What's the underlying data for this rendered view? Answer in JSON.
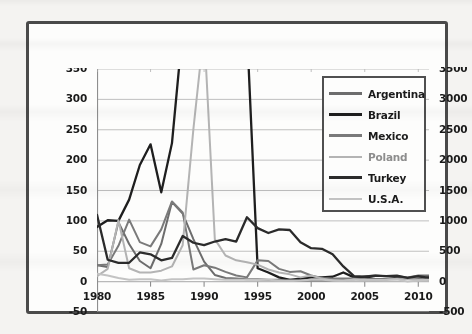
{
  "chart_data": {
    "type": "line",
    "title": "",
    "xlabel": "",
    "ylabel": "",
    "grid": true,
    "legend_position": "top-right-inside",
    "x": [
      1980,
      1981,
      1982,
      1983,
      1984,
      1985,
      1986,
      1987,
      1988,
      1989,
      1990,
      1991,
      1992,
      1993,
      1994,
      1995,
      1996,
      1997,
      1998,
      1999,
      2000,
      2001,
      2002,
      2003,
      2004,
      2005,
      2006,
      2007,
      2008,
      2009,
      2010,
      2011
    ],
    "x_ticks": [
      "1980",
      "1985",
      "1990",
      "1995",
      "2000",
      "2005",
      "2010"
    ],
    "x_tick_values": [
      1980,
      1985,
      1990,
      1995,
      2000,
      2005,
      2010
    ],
    "xlim": [
      1980,
      2011
    ],
    "axis_left": {
      "ticks": [
        -50,
        0,
        50,
        100,
        150,
        200,
        250,
        300,
        350
      ],
      "tick_labels": [
        "-50",
        "0",
        "50",
        "100",
        "150",
        "200",
        "250",
        "300",
        "350"
      ],
      "ylim": [
        -50,
        350
      ],
      "top_label_clipped": true
    },
    "axis_right": {
      "ticks": [
        -500,
        0,
        500,
        1000,
        1500,
        2000,
        2500,
        3000,
        3500
      ],
      "tick_labels": [
        "-500",
        "0",
        "500",
        "1000",
        "1500",
        "2000",
        "2500",
        "3000",
        "3500"
      ],
      "ylim": [
        -500,
        3500
      ]
    },
    "series": [
      {
        "name": "Argentina",
        "color": "#6d6d6d",
        "width": 2.0,
        "axis": "left",
        "values": [
          27,
          24,
          98,
          62,
          34,
          22,
          62,
          131,
          112,
          70,
          33,
          11,
          6,
          5,
          4,
          4,
          3,
          3,
          3,
          2,
          2,
          2,
          2,
          3,
          4,
          9,
          10,
          9,
          9,
          7,
          10,
          10
        ]
      },
      {
        "name": "Brazil",
        "color": "#1e1e1e",
        "width": 2.3,
        "axis": "left",
        "values": [
          90,
          101,
          100,
          135,
          192,
          226,
          147,
          228,
          629,
          1431,
          2948,
          433,
          1120,
          2477,
          916,
          22,
          15,
          7,
          3,
          5,
          7,
          7,
          8,
          15,
          7,
          7,
          4,
          4,
          6,
          5,
          5,
          7
        ]
      },
      {
        "name": "Mexico",
        "color": "#7a7a7a",
        "width": 2.0,
        "axis": "left",
        "values": [
          27,
          28,
          59,
          102,
          65,
          58,
          86,
          132,
          114,
          20,
          27,
          23,
          16,
          10,
          7,
          35,
          34,
          21,
          16,
          17,
          10,
          6,
          5,
          5,
          5,
          4,
          4,
          4,
          5,
          5,
          4,
          3
        ]
      },
      {
        "name": "Poland",
        "color": "#b4b4b4",
        "width": 2.0,
        "axis": "left",
        "values": [
          9,
          21,
          101,
          22,
          15,
          15,
          18,
          25,
          60,
          251,
          586,
          70,
          43,
          35,
          32,
          28,
          20,
          15,
          12,
          7,
          10,
          5,
          2,
          1,
          4,
          2,
          1,
          3,
          4,
          4,
          3,
          4
        ]
      },
      {
        "name": "Turkey",
        "color": "#2b2b2b",
        "width": 2.3,
        "axis": "left",
        "values": [
          110,
          36,
          31,
          31,
          48,
          45,
          35,
          39,
          75,
          64,
          60,
          66,
          70,
          66,
          106,
          88,
          80,
          86,
          85,
          65,
          55,
          54,
          45,
          25,
          9,
          8,
          10,
          9,
          10,
          6,
          9,
          6
        ]
      },
      {
        "name": "U.S.A.",
        "color": "#c3c3c3",
        "width": 2.0,
        "axis": "left",
        "values": [
          13,
          10,
          6,
          3,
          4,
          4,
          2,
          4,
          4,
          5,
          5,
          4,
          3,
          3,
          3,
          3,
          3,
          2,
          2,
          2,
          3,
          3,
          2,
          2,
          3,
          3,
          3,
          3,
          4,
          0,
          2,
          3
        ]
      }
    ]
  },
  "legend": {
    "items": [
      {
        "label": "Argentina",
        "color": "#6d6d6d",
        "width": 3.0,
        "faded": false
      },
      {
        "label": "Brazil",
        "color": "#1e1e1e",
        "width": 3.4,
        "faded": false
      },
      {
        "label": "Mexico",
        "color": "#7a7a7a",
        "width": 3.0,
        "faded": false
      },
      {
        "label": "Poland",
        "color": "#b4b4b4",
        "width": 2.6,
        "faded": true
      },
      {
        "label": "Turkey",
        "color": "#2b2b2b",
        "width": 3.4,
        "faded": false
      },
      {
        "label": "U.S.A.",
        "color": "#c3c3c3",
        "width": 2.6,
        "faded": false
      }
    ]
  },
  "style": {
    "frame_border": "#4a4a4a",
    "grid_color": "#b9b9b9",
    "axis_color": "#8e8e8e",
    "page_background": "#f4f3f1",
    "plot_background": "#fdfdfc"
  }
}
